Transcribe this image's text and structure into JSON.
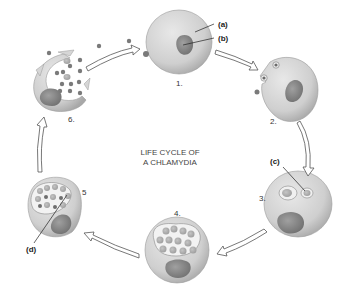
{
  "title_line1": "LIFE CYCLE OF",
  "title_line2": "A CHLAMYDIA",
  "stages": [
    {
      "label": "1."
    },
    {
      "label": "2."
    },
    {
      "label": "3."
    },
    {
      "label": "4."
    },
    {
      "label": "5"
    },
    {
      "label": "6."
    }
  ],
  "callouts": {
    "a": "(a)",
    "b": "(b)",
    "c": "(c)",
    "d": "(d)"
  },
  "colors": {
    "cell": "#d0d0d0",
    "cell_edge": "#9a9a9a",
    "nucleus": "#8c8c8c",
    "body_particle": "#7a7a7a",
    "inclusion": "#f2f2f2"
  }
}
